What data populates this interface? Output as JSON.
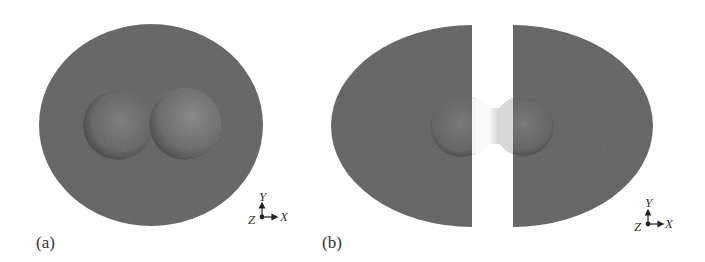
{
  "figure": {
    "panels": [
      {
        "id": "a",
        "label": "(a)",
        "description": "Closed outer isosurface enclosing two spheres",
        "axes": {
          "y": "Y",
          "x": "X",
          "z": "Z"
        }
      },
      {
        "id": "b",
        "label": "(b)",
        "description": "Two separated lobes with central dumbbell-shaped isosurface",
        "axes": {
          "y": "Y",
          "x": "X",
          "z": "Z"
        }
      }
    ],
    "colors": {
      "surface_dark": "#6b6b6b",
      "surface_mid": "#7a7a7a",
      "inner_light": "#f2f2f2",
      "background": "#ffffff"
    }
  }
}
